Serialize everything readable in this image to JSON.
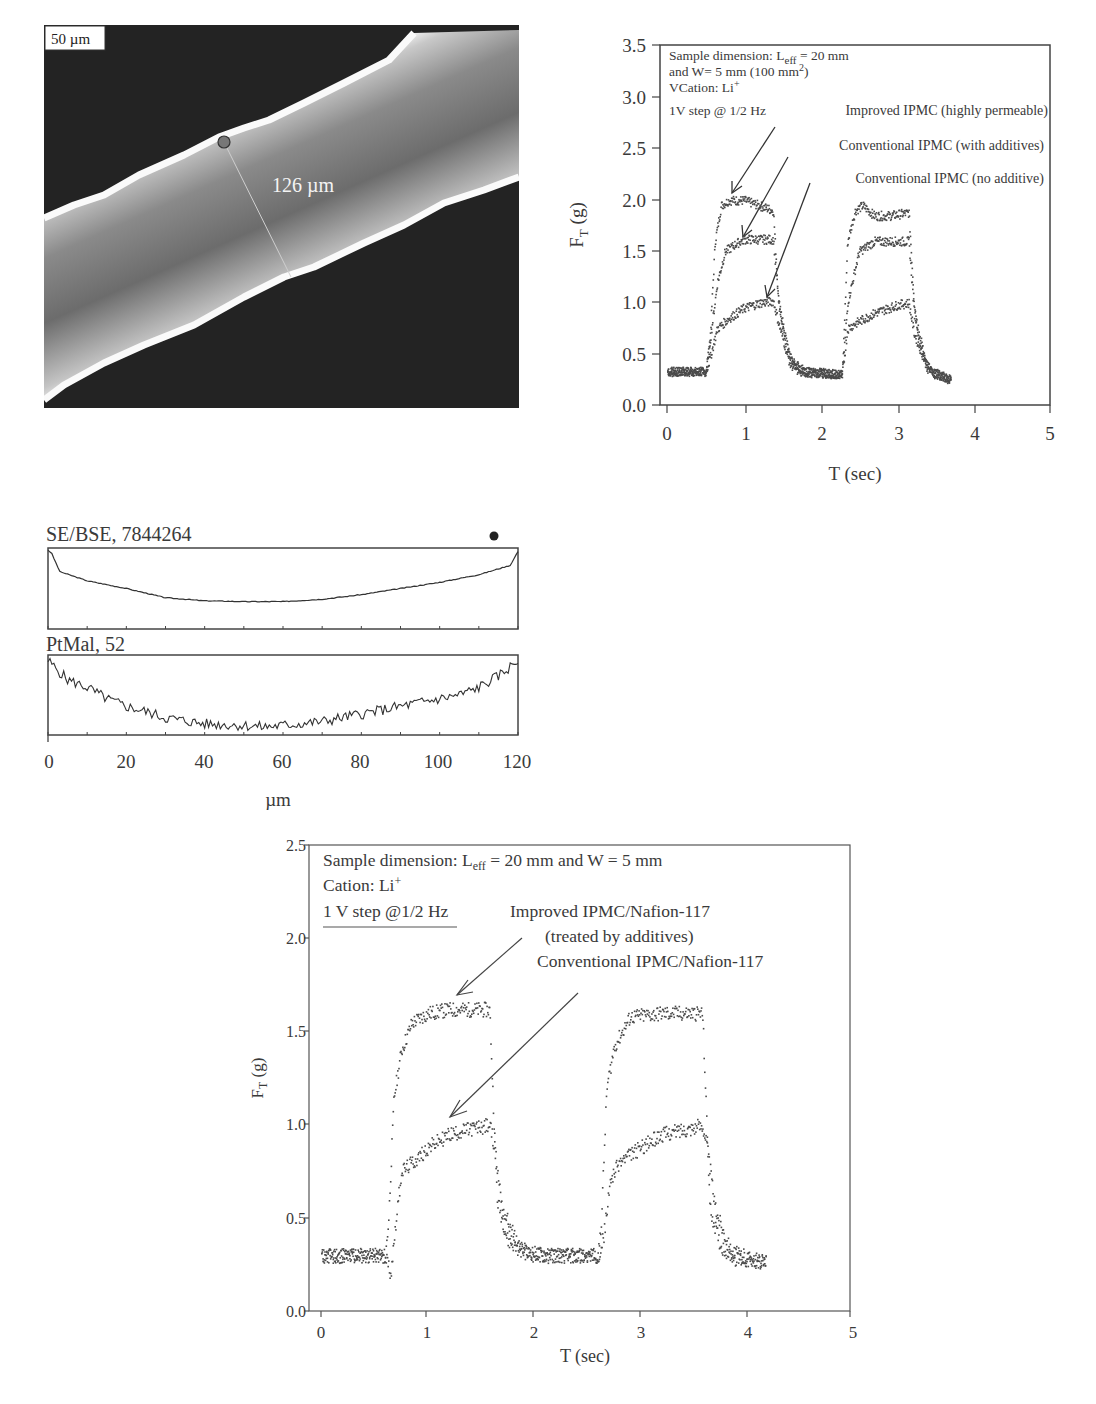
{
  "sem_image": {
    "scale_bar_label": "50 µm",
    "measurement_label": "126 µm",
    "colors": {
      "background": "#1e1e1e",
      "band_center": "#6a6a6a",
      "edge": "#f4f4f4"
    }
  },
  "linescan": {
    "top_label": "SE/BSE, 7844264",
    "bottom_label": "PtMal, 52",
    "x_ticks": [
      "0",
      "20",
      "40",
      "60",
      "80",
      "100",
      "120"
    ],
    "xlabel": "µm"
  },
  "chart_a": {
    "legend_lines": [
      "Sample dimension: L",
      "eff",
      " = 20 mm",
      "and W= 5 mm (100 mm",
      "2",
      ")",
      "VCation: Li",
      "+",
      "1V step @ 1/2 Hz"
    ],
    "annotations": [
      "Improved IPMC (highly permeable)",
      "Conventional IPMC (with additives)",
      "Conventional IPMC (no additive)"
    ],
    "y_ticks": [
      "0.0",
      "0.5",
      "1.0",
      "1.5",
      "2.0",
      "2.5",
      "3.0",
      "3.5"
    ],
    "x_ticks": [
      "0",
      "1",
      "2",
      "3",
      "4",
      "5"
    ],
    "ylabel_main": "F",
    "ylabel_sub": "T",
    "ylabel_unit": " (g)",
    "xlabel": "T (sec)"
  },
  "chart_b": {
    "legend_line1_pre": "Sample dimension: L",
    "legend_line1_sub": "eff",
    "legend_line1_post": " = 20 mm and W = 5 mm",
    "legend_line2": "Cation: Li",
    "legend_line2_sup": "+",
    "legend_line3": "1 V step @1/2 Hz",
    "annotations": [
      "Improved IPMC/Nafion-117",
      "(treated by additives)",
      "Conventional IPMC/Nafion-117"
    ],
    "y_ticks": [
      "0.0",
      "0.5",
      "1.0",
      "1.5",
      "2.0",
      "2.5"
    ],
    "x_ticks": [
      "0",
      "1",
      "2",
      "3",
      "4",
      "5"
    ],
    "ylabel_main": "F",
    "ylabel_sub": "T",
    "ylabel_unit": " (g)",
    "xlabel": "T (sec)"
  },
  "chart_data": [
    {
      "type": "scatter",
      "title": "",
      "xlabel": "T (sec)",
      "ylabel": "F_T (g)",
      "xlim": [
        0,
        5
      ],
      "ylim": [
        0,
        3.5
      ],
      "grid": false,
      "annotations": [
        "Sample dimension: L_eff = 20 mm and W= 5 mm (100 mm^2)",
        "VCation: Li+",
        "1V step @ 1/2 Hz"
      ],
      "series": [
        {
          "name": "Improved IPMC (highly permeable)",
          "x": [
            0,
            0.5,
            0.55,
            0.62,
            0.7,
            0.8,
            1.0,
            1.2,
            1.38,
            1.45,
            1.55,
            1.7,
            2.0,
            2.28,
            2.35,
            2.45,
            2.55,
            2.7,
            2.9,
            3.15,
            3.22,
            3.3,
            3.45,
            3.7
          ],
          "y": [
            0.33,
            0.33,
            0.6,
            1.6,
            1.95,
            2.0,
            2.0,
            1.95,
            1.9,
            1.0,
            0.55,
            0.33,
            0.32,
            0.3,
            1.6,
            1.9,
            1.95,
            1.85,
            1.85,
            1.88,
            1.0,
            0.55,
            0.32,
            0.25
          ]
        },
        {
          "name": "Conventional IPMC (with additives)",
          "x": [
            0,
            0.5,
            0.55,
            0.65,
            0.75,
            0.9,
            1.0,
            1.2,
            1.38,
            1.45,
            1.6,
            1.8,
            2.0,
            2.28,
            2.35,
            2.5,
            2.7,
            3.0,
            3.15,
            3.22,
            3.4,
            3.7
          ],
          "y": [
            0.33,
            0.33,
            0.6,
            1.2,
            1.5,
            1.58,
            1.62,
            1.62,
            1.62,
            1.0,
            0.45,
            0.33,
            0.32,
            0.3,
            1.0,
            1.5,
            1.6,
            1.6,
            1.6,
            0.9,
            0.35,
            0.25
          ]
        },
        {
          "name": "Conventional IPMC (no additive)",
          "x": [
            0,
            0.5,
            0.55,
            0.65,
            0.8,
            1.0,
            1.2,
            1.38,
            1.45,
            1.6,
            1.8,
            2.0,
            2.28,
            2.35,
            2.45,
            2.7,
            3.0,
            3.15,
            3.22,
            3.4,
            3.7
          ],
          "y": [
            0.33,
            0.33,
            0.45,
            0.75,
            0.85,
            0.95,
            1.0,
            1.02,
            0.8,
            0.4,
            0.32,
            0.32,
            0.3,
            0.75,
            0.8,
            0.9,
            0.98,
            1.0,
            0.7,
            0.35,
            0.25
          ]
        }
      ]
    },
    {
      "type": "line",
      "title": "Line scan profiles",
      "xlabel": "µm",
      "ylabel": "",
      "xlim": [
        0,
        120
      ],
      "grid": false,
      "series": [
        {
          "name": "SE/BSE, 7844264",
          "x": [
            0,
            1,
            3,
            10,
            20,
            30,
            40,
            50,
            60,
            70,
            80,
            90,
            100,
            110,
            118,
            120
          ],
          "y": [
            1.0,
            0.95,
            0.72,
            0.6,
            0.5,
            0.38,
            0.34,
            0.33,
            0.33,
            0.36,
            0.42,
            0.5,
            0.58,
            0.68,
            0.8,
            0.98
          ]
        },
        {
          "name": "PtMal, 52",
          "x": [
            0,
            2,
            5,
            10,
            15,
            20,
            25,
            30,
            40,
            50,
            55,
            60,
            70,
            80,
            90,
            100,
            105,
            110,
            115,
            120
          ],
          "y": [
            0.95,
            0.85,
            0.7,
            0.6,
            0.45,
            0.35,
            0.28,
            0.2,
            0.12,
            0.1,
            0.08,
            0.1,
            0.15,
            0.25,
            0.35,
            0.45,
            0.5,
            0.6,
            0.75,
            0.95
          ]
        }
      ]
    },
    {
      "type": "scatter",
      "title": "",
      "xlabel": "T (sec)",
      "ylabel": "F_T (g)",
      "xlim": [
        0,
        5
      ],
      "ylim": [
        0,
        2.5
      ],
      "grid": false,
      "annotations": [
        "Sample dimension: L_eff = 20 mm and W = 5 mm",
        "Cation: Li+",
        "1 V step @1/2 Hz"
      ],
      "series": [
        {
          "name": "Improved IPMC/Nafion-117 (treated by additives)",
          "x": [
            0,
            0.6,
            0.63,
            0.68,
            0.75,
            0.85,
            1.0,
            1.2,
            1.58,
            1.6,
            1.65,
            1.75,
            1.9,
            2.2,
            2.6,
            2.63,
            2.68,
            2.75,
            2.9,
            3.2,
            3.58,
            3.6,
            3.65,
            3.75,
            3.9,
            4.18
          ],
          "y": [
            0.3,
            0.3,
            0.5,
            1.15,
            1.4,
            1.55,
            1.6,
            1.62,
            1.62,
            1.3,
            0.6,
            0.38,
            0.32,
            0.3,
            0.3,
            0.5,
            1.2,
            1.42,
            1.58,
            1.6,
            1.6,
            1.3,
            0.55,
            0.35,
            0.28,
            0.26
          ]
        },
        {
          "name": "Conventional IPMC/Nafion-117",
          "x": [
            0,
            0.6,
            0.65,
            0.7,
            0.75,
            0.9,
            1.0,
            1.2,
            1.4,
            1.58,
            1.62,
            1.7,
            1.85,
            2.0,
            2.6,
            2.65,
            2.72,
            2.8,
            3.0,
            3.2,
            3.58,
            3.62,
            3.7,
            3.85,
            4.18
          ],
          "y": [
            0.3,
            0.3,
            0.2,
            0.5,
            0.75,
            0.82,
            0.88,
            0.95,
            0.98,
            1.0,
            0.9,
            0.55,
            0.35,
            0.3,
            0.3,
            0.4,
            0.72,
            0.8,
            0.88,
            0.95,
            1.0,
            0.9,
            0.55,
            0.32,
            0.26
          ]
        }
      ]
    }
  ]
}
